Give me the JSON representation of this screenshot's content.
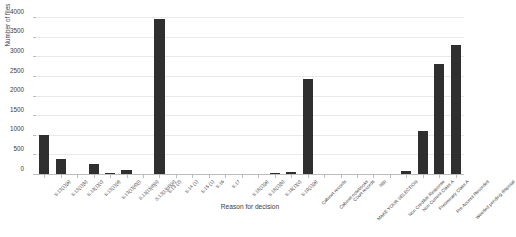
{
  "chart_data": {
    "type": "bar",
    "title": "",
    "subtitle": "",
    "xlabel": "Reason for decision",
    "ylabel": "Number of files",
    "ylim": [
      0,
      4000
    ],
    "yticks": [
      0,
      500,
      1000,
      1500,
      2000,
      2500,
      3000,
      3500,
      4000
    ],
    "grid": true,
    "legend": null,
    "legend_position": "none",
    "bar_color": "#2f2f2f",
    "grid_color": "#e9e9ea",
    "axis_color": "#bdbdbd",
    "text_color": "#3c3c3c",
    "categories": [
      "S.13(1)(a)",
      "S.13(1)(b)",
      "S.13(1)(c)",
      "S.13(1)(d)",
      "S.13(1)(d)(i)",
      "S.13(1)(d)(ii)",
      "S.13(1)(d)(iii)",
      "S.13 (2)",
      "S.14 (1)",
      "S.15 (1)",
      "S.16",
      "S.17",
      "S.18(1)(a)",
      "S.18(1)(b)",
      "S.18(1)(c)",
      "S.19(1)(a)",
      "Cabinet records",
      "Cabinet notebooks",
      "Court records",
      "MAKE YOUR SELECTION",
      "NBI",
      "Non Credible Response",
      "Non Current Class A",
      "Preliminary Class A",
      "Pre Access Recorded",
      "Weeded pending disposal"
    ],
    "values": [
      1010,
      420,
      8,
      270,
      45,
      118,
      35,
      3985,
      6,
      5,
      4,
      4,
      18,
      22,
      40,
      65,
      2450,
      6,
      12,
      6,
      8,
      12,
      110,
      1110,
      2830,
      3300
    ],
    "series": [
      {
        "name": "Number of files",
        "values": [
          1010,
          420,
          8,
          270,
          45,
          118,
          35,
          3985,
          6,
          5,
          4,
          4,
          18,
          22,
          40,
          65,
          2450,
          6,
          12,
          6,
          8,
          12,
          110,
          1110,
          2830,
          3300
        ]
      }
    ]
  }
}
